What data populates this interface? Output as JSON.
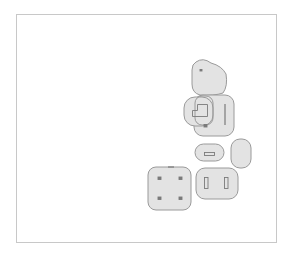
{
  "canvas": {
    "width": 293,
    "height": 256,
    "background": "#ffffff"
  },
  "frame": {
    "x": 16.5,
    "y": 14.5,
    "w": 260,
    "h": 228,
    "stroke": "#c8c8c8"
  },
  "style": {
    "fill": "#e3e3e3",
    "stroke": "#9a9a9a",
    "detail": "#7a7a7a"
  },
  "shapes": [
    {
      "name": "top-blob",
      "type": "path",
      "d": "M196 62 Q203 57 211 63 Q222 66 226 74 Q228 86 223 93 Q214 96 200 95 Q192 93 192 84 L192 70 Q192 64 196 62 Z"
    },
    {
      "name": "middle-right-block",
      "type": "rect",
      "x": 194,
      "y": 95,
      "w": 40,
      "h": 41,
      "r": 9
    },
    {
      "name": "middle-left-blob",
      "type": "rect",
      "x": 184,
      "y": 97,
      "w": 29,
      "h": 29,
      "r": 11
    },
    {
      "name": "middle-overlay-outline",
      "type": "rect",
      "x": 195,
      "y": 96,
      "w": 18,
      "h": 29,
      "r": 7,
      "nofill": true
    },
    {
      "name": "pill-slot-shape",
      "type": "rect",
      "x": 195,
      "y": 144,
      "w": 29,
      "h": 17,
      "r": 8.5
    },
    {
      "name": "right-oval",
      "type": "rect",
      "x": 231,
      "y": 139,
      "w": 20,
      "h": 29,
      "r": 9
    },
    {
      "name": "two-slot-shape",
      "type": "rect",
      "x": 196,
      "y": 168,
      "w": 42,
      "h": 31,
      "r": 9
    },
    {
      "name": "four-pad-square",
      "type": "rect",
      "x": 148,
      "y": 167,
      "w": 43,
      "h": 43,
      "r": 8
    }
  ],
  "details": [
    {
      "name": "top-dot",
      "type": "rect",
      "x": 200,
      "y": 69.5,
      "w": 2,
      "h": 1.5
    },
    {
      "name": "stair-outline",
      "type": "path",
      "d": "M192.5 116.5 L192.5 110.5 L197.5 110.5 L197.5 104.5 L207.5 104.5 L207.5 116.5 Z"
    },
    {
      "name": "vertical-bar",
      "type": "line",
      "x1": 225,
      "y1": 104,
      "x2": 225,
      "y2": 125
    },
    {
      "name": "small-square-pad",
      "type": "rect",
      "x": 204,
      "y": 124.5,
      "w": 3,
      "h": 2.5
    },
    {
      "name": "horizontal-slot",
      "type": "rect",
      "x": 204.5,
      "y": 152.5,
      "w": 10,
      "h": 3
    },
    {
      "name": "left-slot",
      "type": "rect",
      "x": 204.5,
      "y": 177.5,
      "w": 3.5,
      "h": 11
    },
    {
      "name": "right-slot",
      "type": "rect",
      "x": 224.5,
      "y": 177.5,
      "w": 3.5,
      "h": 11
    },
    {
      "name": "pad-top-left",
      "type": "rect",
      "x": 158,
      "y": 177,
      "w": 3,
      "h": 2.5
    },
    {
      "name": "pad-top-right",
      "type": "rect",
      "x": 179,
      "y": 177,
      "w": 3,
      "h": 2.5
    },
    {
      "name": "pad-bottom-left",
      "type": "rect",
      "x": 158,
      "y": 197,
      "w": 3,
      "h": 2.5
    },
    {
      "name": "pad-bottom-right",
      "type": "rect",
      "x": 179,
      "y": 197,
      "w": 3,
      "h": 2.5
    },
    {
      "name": "top-edge-mark",
      "type": "line",
      "x1": 168,
      "y1": 167,
      "x2": 174,
      "y2": 167
    }
  ]
}
